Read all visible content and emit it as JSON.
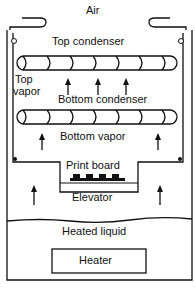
{
  "diagram": {
    "labels": {
      "air": "Air",
      "top_condenser": "Top condenser",
      "top_vapor_1": "Top",
      "top_vapor_2": "vapor",
      "bottom_condenser": "Bottom condenser",
      "bottom_vapor": "Bottom vapor",
      "print_board": "Print board",
      "elevator": "Elevator",
      "heated_liquid": "Heated liquid",
      "heater": "Heater"
    },
    "colors": {
      "line": "#111111",
      "background": "#ffffff"
    }
  }
}
